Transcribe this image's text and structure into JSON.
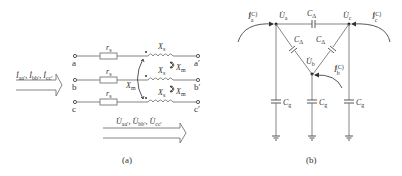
{
  "panel_a": {
    "caption": "(a)",
    "input_current_label": "İaa′, İbb′, İcc′",
    "input_current_parts": [
      "İ",
      "aa′",
      ", İ",
      "bb′",
      ", İ",
      "cc′"
    ],
    "voltage_drop_label": "U̇aa′, U̇bb′, U̇cc′",
    "voltage_parts": [
      "U̇",
      "aa′",
      ", U̇",
      "bb′",
      ", U̇",
      "cc′"
    ],
    "terminals_left": [
      "a",
      "b",
      "c"
    ],
    "terminals_right": [
      "a′",
      "b′",
      "c′"
    ],
    "resistor_label": "r",
    "resistor_sub": "s",
    "self_reactance_label": "X",
    "self_reactance_sub": "s",
    "mutual_reactance_label": "X",
    "mutual_reactance_sub": "m"
  },
  "panel_b": {
    "caption": "(b)",
    "node_voltages": [
      {
        "main": "U̇",
        "sub": "a"
      },
      {
        "main": "U̇",
        "sub": "b"
      },
      {
        "main": "U̇",
        "sub": "c"
      }
    ],
    "injected_currents": [
      {
        "main": "İ",
        "sub": "a",
        "sup": "(C)"
      },
      {
        "main": "İ",
        "sub": "b",
        "sup": "(C)"
      },
      {
        "main": "İ",
        "sub": "c",
        "sup": "(C)"
      }
    ],
    "delta_capacitor": {
      "main": "C",
      "sub": "Δ"
    },
    "ground_capacitor": {
      "main": "C",
      "sub": "g"
    }
  }
}
